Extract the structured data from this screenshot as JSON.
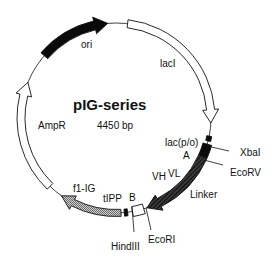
{
  "diagram": {
    "title": "pIG-series",
    "size_label": "4450 bp",
    "geometry": {
      "cx": 116,
      "cy": 118,
      "r": 95
    },
    "colors": {
      "line": "#111111",
      "black": "#0a0a0a",
      "dark_hatch": "#2a2a2a",
      "gray_hatch": "#9a9a9a",
      "open": "#ffffff"
    },
    "features": [
      {
        "name": "ori",
        "style": "solid-black",
        "start": 311,
        "end": 355,
        "width": 9,
        "head": true
      },
      {
        "name": "lacI",
        "style": "open",
        "start": 7,
        "end": 93,
        "width": 8,
        "head": true
      },
      {
        "name": "lac(p/o)",
        "style": "solid-black",
        "start": 101,
        "end": 104,
        "width": 5,
        "head": false
      },
      {
        "name": "A",
        "style": "solid-black",
        "start": 106,
        "end": 114,
        "width": 9,
        "head": false
      },
      {
        "name": "VL-Linker-VH",
        "style": "dark-hatch",
        "start": 114,
        "end": 161,
        "width": 9,
        "head": true
      },
      {
        "name": "B",
        "style": "open",
        "start": 163,
        "end": 170,
        "width": 10,
        "head": false
      },
      {
        "name": "tIPP",
        "style": "solid-black",
        "start": 173,
        "end": 175,
        "width": 7,
        "head": false
      },
      {
        "name": "f1-IG",
        "style": "gray-hatch",
        "start": 177,
        "end": 215,
        "width": 7,
        "head": true,
        "reverse": true
      },
      {
        "name": "AmpR",
        "style": "open",
        "start": 224,
        "end": 292,
        "width": 8,
        "head": true
      }
    ],
    "labels": [
      {
        "text": "ori",
        "x": 81,
        "y": 48
      },
      {
        "text": "lacI",
        "x": 160,
        "y": 67
      },
      {
        "text": "AmpR",
        "x": 38,
        "y": 129
      },
      {
        "text": "lac(p/o)",
        "x": 165,
        "y": 146
      },
      {
        "text": "A",
        "x": 183,
        "y": 159
      },
      {
        "text": "VL",
        "x": 168,
        "y": 177
      },
      {
        "text": "VH",
        "x": 152,
        "y": 180
      },
      {
        "text": "Linker",
        "x": 190,
        "y": 198
      },
      {
        "text": "XbaI",
        "x": 240,
        "y": 156
      },
      {
        "text": "EcoRV",
        "x": 230,
        "y": 176
      },
      {
        "text": "f1-IG",
        "x": 73,
        "y": 192
      },
      {
        "text": "tIPP",
        "x": 103,
        "y": 202
      },
      {
        "text": "B",
        "x": 129,
        "y": 201
      },
      {
        "text": "HindIII",
        "x": 111,
        "y": 250
      },
      {
        "text": "EcoRI",
        "x": 148,
        "y": 243
      }
    ],
    "sites": [
      {
        "name": "XbaI",
        "x1": 207,
        "y1": 146,
        "x2": 229,
        "y2": 151
      },
      {
        "name": "EcoRV",
        "x1": 204,
        "y1": 160,
        "x2": 223,
        "y2": 165
      },
      {
        "name": "HindIII",
        "x1": 132,
        "y1": 207,
        "x2": 134,
        "y2": 232
      },
      {
        "name": "EcoRI",
        "x1": 146,
        "y1": 208,
        "x2": 151,
        "y2": 230
      }
    ]
  }
}
